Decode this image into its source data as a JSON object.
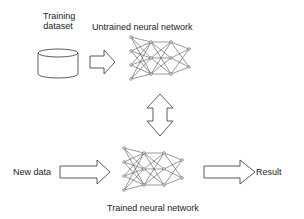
{
  "labels": {
    "training_dataset_line1": "Training",
    "training_dataset_line2": "dataset",
    "untrained_network": "Untrained neural network",
    "new_data": "New data",
    "result": "Result",
    "trained_network": "Trained neural network"
  },
  "colors": {
    "stroke": "#333333",
    "background": "#ffffff"
  },
  "icons": [
    "database-cylinder-icon",
    "arrow-right-icon",
    "neural-network-icon",
    "double-arrow-vertical-icon"
  ]
}
